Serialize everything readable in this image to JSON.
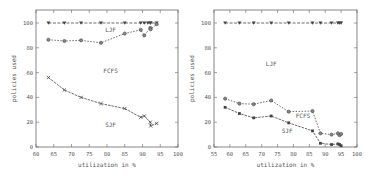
{
  "chart_data": [
    {
      "type": "line",
      "title": "",
      "xlabel": "utilization in %",
      "ylabel": "policies used",
      "xlim": [
        60,
        100
      ],
      "ylim": [
        0,
        110
      ],
      "xticks": [
        60,
        65,
        70,
        75,
        80,
        85,
        90,
        95,
        100
      ],
      "yticks": [
        0,
        20,
        40,
        60,
        80,
        100
      ],
      "grid": false,
      "legend": "none (inline region labels)",
      "annotations": [
        {
          "text": "LJF",
          "x": 81,
          "y": 93
        },
        {
          "text": "FCFS",
          "x": 81,
          "y": 60
        },
        {
          "text": "SJF",
          "x": 81,
          "y": 16
        }
      ],
      "series": [
        {
          "name": "LJF boundary",
          "marker": "triangle-down",
          "x": [
            63.5,
            68,
            72.7,
            78.3,
            85,
            89.5,
            90.5,
            91.5,
            92.2,
            92.3,
            94
          ],
          "y": [
            100,
            100,
            100,
            100,
            100,
            100,
            100,
            100,
            100,
            100,
            100
          ]
        },
        {
          "name": "FCFS boundary",
          "marker": "circle",
          "x": [
            63.5,
            68,
            72.7,
            78.3,
            85,
            89.5,
            90.5,
            92.2,
            92.3,
            94
          ],
          "y": [
            86.5,
            85.5,
            86,
            84,
            91.5,
            94.5,
            90,
            96,
            95,
            99
          ]
        },
        {
          "name": "SJF boundary",
          "marker": "x",
          "x": [
            63.5,
            68,
            72.7,
            78.3,
            85,
            89.5,
            90.5,
            92.2,
            92.3,
            94
          ],
          "y": [
            56,
            46,
            40,
            35,
            31,
            24,
            25,
            20,
            17,
            19
          ]
        }
      ]
    },
    {
      "type": "line",
      "title": "",
      "xlabel": "utilization in %",
      "ylabel": "policies used",
      "xlim": [
        55,
        100
      ],
      "ylim": [
        0,
        110
      ],
      "xticks": [
        55,
        60,
        65,
        70,
        75,
        80,
        85,
        90,
        95,
        100
      ],
      "yticks": [
        0,
        20,
        40,
        60,
        80,
        100
      ],
      "grid": false,
      "legend": "none (inline region labels)",
      "annotations": [
        {
          "text": "LJF",
          "x": 73,
          "y": 65
        },
        {
          "text": "FCFS",
          "x": 83,
          "y": 23
        },
        {
          "text": "SJF",
          "x": 78,
          "y": 11
        }
      ],
      "series": [
        {
          "name": "LJF boundary",
          "marker": "triangle-down",
          "x": [
            58.5,
            63,
            67.5,
            73,
            78.5,
            86,
            88.5,
            92,
            94,
            94.5,
            95
          ],
          "y": [
            100,
            100,
            100,
            100,
            100,
            100,
            100,
            100,
            100,
            100,
            100
          ]
        },
        {
          "name": "FCFS boundary",
          "marker": "circle",
          "x": [
            58.5,
            63,
            67.5,
            73,
            78.5,
            86,
            88.5,
            92,
            94,
            94.5,
            95
          ],
          "y": [
            39,
            35,
            34.5,
            37.5,
            28.5,
            29,
            11,
            10,
            11,
            9.5,
            10.5
          ]
        },
        {
          "name": "SJF boundary",
          "marker": "square",
          "x": [
            58.5,
            63,
            67.5,
            73,
            78.5,
            86,
            88.5,
            92,
            94,
            94.5,
            95
          ],
          "y": [
            32,
            27,
            23.5,
            25,
            19.5,
            13,
            3,
            2,
            2.5,
            2,
            1
          ]
        }
      ]
    }
  ]
}
